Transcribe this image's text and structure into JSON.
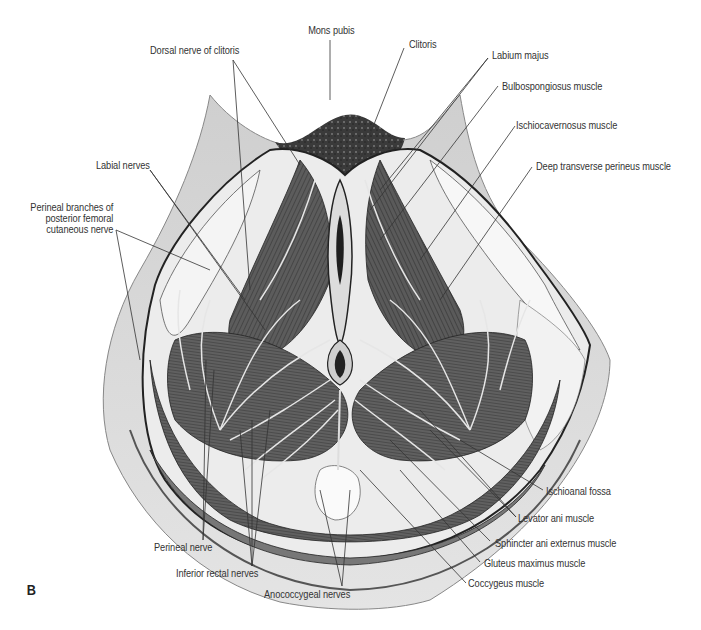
{
  "figure": {
    "panel_letter": "B",
    "labels": {
      "mons_pubis": "Mons pubis",
      "dorsal_nerve_clitoris": "Dorsal nerve of clitoris",
      "clitoris": "Clitoris",
      "labium_majus": "Labium majus",
      "bulbospongiosus": "Bulbospongiosus muscle",
      "ischiocavernosus": "Ischiocavernosus muscle",
      "deep_transverse_perineus": "Deep transverse perineus muscle",
      "labial_nerves": "Labial nerves",
      "perineal_branches": "Perineal branches of\nposterior femoral\ncutaneous nerve",
      "ischioanal_fossa": "Ischioanal fossa",
      "levator_ani": "Levator ani muscle",
      "sphincter_ani_externus": "Sphincter ani externus muscle",
      "gluteus_maximus": "Gluteus maximus muscle",
      "coccygeus": "Coccygeus muscle",
      "perineal_nerve": "Perineal nerve",
      "inferior_rectal_nerves": "Inferior rectal nerves",
      "anococcygeal_nerves": "Anococcygeal nerves"
    },
    "colors": {
      "skin": "#d9d9d9",
      "muscle": "#5a5a5a",
      "muscle_dark": "#3a3a3a",
      "fat": "#efefef",
      "leader": "#333333",
      "nerve": "#e6e6e6"
    }
  }
}
